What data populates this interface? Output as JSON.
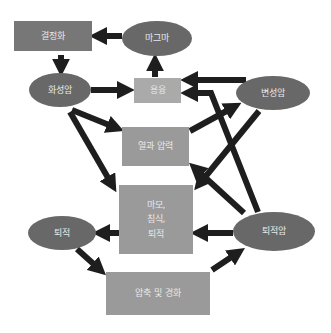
{
  "diagram": {
    "title": "",
    "nodes": {
      "crystallization": {
        "label": "결정화",
        "shape": "box"
      },
      "magma": {
        "label": "마그마",
        "shape": "ellipse"
      },
      "igneous_rock": {
        "label": "화성암",
        "shape": "ellipse"
      },
      "melting": {
        "label": "용융",
        "shape": "box"
      },
      "metamorphic_rock": {
        "label": "변성암",
        "shape": "ellipse"
      },
      "heat_pressure": {
        "label": "열과 압력",
        "shape": "box"
      },
      "weathering": {
        "lines": [
          "마모,",
          "침식,",
          "퇴적"
        ],
        "shape": "box"
      },
      "sediment": {
        "label": "퇴적",
        "shape": "ellipse"
      },
      "sedimentary_rock": {
        "label": "퇴적암",
        "shape": "ellipse"
      },
      "compaction": {
        "label": "압축 및 경화",
        "shape": "box"
      }
    },
    "edges": [
      {
        "from": "magma",
        "to": "crystallization"
      },
      {
        "from": "crystallization",
        "to": "igneous_rock"
      },
      {
        "from": "igneous_rock",
        "to": "melting"
      },
      {
        "from": "melting",
        "to": "magma"
      },
      {
        "from": "metamorphic_rock",
        "to": "melting"
      },
      {
        "from": "sedimentary_rock",
        "to": "melting"
      },
      {
        "from": "igneous_rock",
        "to": "heat_pressure"
      },
      {
        "from": "igneous_rock",
        "to": "weathering"
      },
      {
        "from": "heat_pressure",
        "to": "metamorphic_rock"
      },
      {
        "from": "metamorphic_rock",
        "to": "weathering"
      },
      {
        "from": "sedimentary_rock",
        "to": "heat_pressure"
      },
      {
        "from": "weathering",
        "to": "sediment"
      },
      {
        "from": "sedimentary_rock",
        "to": "weathering"
      },
      {
        "from": "sediment",
        "to": "compaction"
      },
      {
        "from": "compaction",
        "to": "sedimentary_rock"
      }
    ],
    "colors": {
      "ellipse": "#686868",
      "box": "#9a9a9a",
      "arrow": "#1e1e1e",
      "text": "#e8e8e8"
    }
  }
}
